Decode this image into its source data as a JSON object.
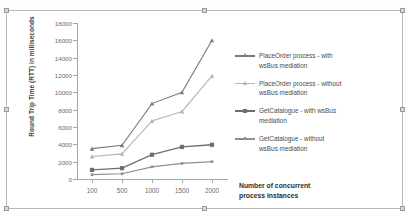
{
  "figure": {
    "background": "#ffffff",
    "frame_color": "#b8b8b8"
  },
  "chart_data": {
    "type": "line",
    "title": "",
    "xlabel": "Number of concurrent process instances",
    "ylabel": "Round Trip Time (RTT) in milliseconds",
    "categories": [
      "100",
      "500",
      "1000",
      "1500",
      "2000"
    ],
    "ylim": [
      0,
      18000
    ],
    "ytick_step": 2000,
    "yticks": [
      "0",
      "2000",
      "4000",
      "6000",
      "8000",
      "10000",
      "12000",
      "14000",
      "16000",
      "18000"
    ],
    "grid": false,
    "legend_position": "right",
    "series": [
      {
        "name": "PlaceOrder process - with wsBus mediation",
        "values": [
          3500,
          3900,
          8700,
          10000,
          16000
        ],
        "color": "#7a7a7a",
        "marker": "triangle"
      },
      {
        "name": "PlaceOrder process - without wsBus mediation",
        "values": [
          2600,
          2900,
          6700,
          7800,
          11900
        ],
        "color": "#b4b4b4",
        "marker": "triangle"
      },
      {
        "name": "GetCatalogue  - with wsBus mediation",
        "values": [
          1050,
          1250,
          2800,
          3700,
          3950
        ],
        "color": "#6e6e6e",
        "marker": "square"
      },
      {
        "name": "GetCatalogue  - without wsBus mediation",
        "values": [
          500,
          600,
          1400,
          1800,
          2000
        ],
        "color": "#8e8e8e",
        "marker": "square-small"
      }
    ]
  },
  "legend": {
    "entries": [
      {
        "line1": "PlaceOrder process - with",
        "line2": "wsBus mediation"
      },
      {
        "line1": "PlaceOrder process - without",
        "line2": "wsBus mediation"
      },
      {
        "line1": "GetCatalogue  - with wsBus",
        "line2": "mediation"
      },
      {
        "line1": "GetCatalogue  - without",
        "line2": "wsBus mediation"
      }
    ]
  },
  "axis": {
    "x_title_line1": "Number of concurrent",
    "x_title_line2": "process instances"
  }
}
